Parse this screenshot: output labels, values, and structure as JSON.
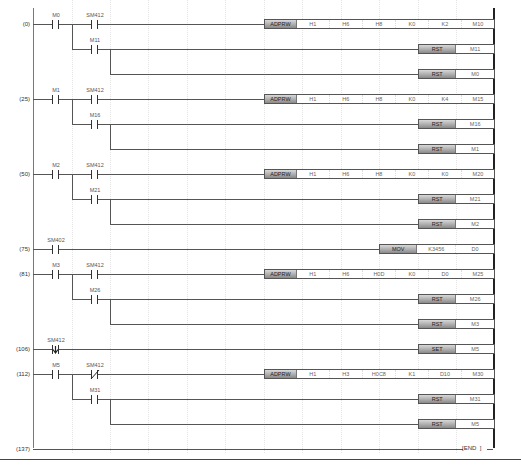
{
  "rungs": [
    {
      "step": "(0)",
      "y": 24,
      "contacts": [
        {
          "dev": "M0",
          "x": 33,
          "type": "no"
        },
        {
          "dev": "SM412",
          "x": 72,
          "type": "no"
        }
      ],
      "branch": {
        "dev": "M11",
        "y": 49,
        "type": "no"
      },
      "outputs": [
        {
          "y": 24,
          "op": "ADPRW",
          "args": [
            "H1",
            "H6",
            "H8",
            "K0",
            "K2",
            "M10"
          ]
        },
        {
          "y": 49,
          "op": "RST",
          "args": [
            "M11"
          ]
        },
        {
          "y": 74,
          "op": "RST",
          "args": [
            "M0"
          ]
        }
      ]
    },
    {
      "step": "(25)",
      "y": 99,
      "contacts": [
        {
          "dev": "M1",
          "x": 33,
          "type": "no"
        },
        {
          "dev": "SM412",
          "x": 72,
          "type": "no"
        }
      ],
      "branch": {
        "dev": "M16",
        "y": 124,
        "type": "no"
      },
      "outputs": [
        {
          "y": 99,
          "op": "ADPRW",
          "args": [
            "H1",
            "H6",
            "H8",
            "K0",
            "K4",
            "M15"
          ]
        },
        {
          "y": 124,
          "op": "RST",
          "args": [
            "M16"
          ]
        },
        {
          "y": 149,
          "op": "RST",
          "args": [
            "M1"
          ]
        }
      ]
    },
    {
      "step": "(50)",
      "y": 174,
      "contacts": [
        {
          "dev": "M2",
          "x": 33,
          "type": "no"
        },
        {
          "dev": "SM412",
          "x": 72,
          "type": "no"
        }
      ],
      "branch": {
        "dev": "M21",
        "y": 199,
        "type": "no"
      },
      "outputs": [
        {
          "y": 174,
          "op": "ADPRW",
          "args": [
            "H1",
            "H6",
            "H8",
            "K0",
            "K0",
            "M20"
          ]
        },
        {
          "y": 199,
          "op": "RST",
          "args": [
            "M21"
          ]
        },
        {
          "y": 224,
          "op": "RST",
          "args": [
            "M2"
          ]
        }
      ]
    },
    {
      "step": "(75)",
      "y": 249,
      "contacts": [
        {
          "dev": "SM402",
          "x": 33,
          "type": "no"
        }
      ],
      "outputs": [
        {
          "y": 249,
          "op": "MOV",
          "args": [
            "K3456",
            "D0"
          ]
        }
      ]
    },
    {
      "step": "(81)",
      "y": 274,
      "contacts": [
        {
          "dev": "M3",
          "x": 33,
          "type": "no"
        },
        {
          "dev": "SM412",
          "x": 72,
          "type": "no"
        }
      ],
      "branch": {
        "dev": "M26",
        "y": 299,
        "type": "no"
      },
      "outputs": [
        {
          "y": 274,
          "op": "ADPRW",
          "args": [
            "H1",
            "H6",
            "H0D",
            "K0",
            "D0",
            "M25"
          ]
        },
        {
          "y": 299,
          "op": "RST",
          "args": [
            "M26"
          ]
        },
        {
          "y": 324,
          "op": "RST",
          "args": [
            "M3"
          ]
        }
      ]
    },
    {
      "step": "(106)",
      "y": 349,
      "contacts": [
        {
          "dev": "SM412",
          "x": 33,
          "type": "falling"
        }
      ],
      "outputs": [
        {
          "y": 349,
          "op": "SET",
          "args": [
            "M5"
          ]
        }
      ]
    },
    {
      "step": "(112)",
      "y": 374,
      "contacts": [
        {
          "dev": "M5",
          "x": 33,
          "type": "no"
        },
        {
          "dev": "SM412",
          "x": 72,
          "type": "nc"
        }
      ],
      "branch": {
        "dev": "M31",
        "y": 399,
        "type": "no"
      },
      "outputs": [
        {
          "y": 374,
          "op": "ADPRW",
          "args": [
            "H1",
            "H3",
            "H0C8",
            "K1",
            "D10",
            "M30"
          ]
        },
        {
          "y": 399,
          "op": "RST",
          "args": [
            "M31"
          ]
        },
        {
          "y": 424,
          "op": "RST",
          "args": [
            "M5"
          ]
        }
      ]
    },
    {
      "step": "(137)",
      "y": 449,
      "end": "END"
    }
  ],
  "labels": {
    "r0": {
      "step": "(0)",
      "c1": "M0",
      "c2": "SM412",
      "b": "M11",
      "o1": "ADPRW",
      "a1": "H1",
      "a2": "H6",
      "a3": "H8",
      "a4": "K0",
      "a5": "K2",
      "a6": "M10",
      "o2": "RST",
      "o2a": "M11",
      "o3": "RST",
      "o3a": "M0"
    },
    "r1": {
      "step": "(25)",
      "c1": "M1",
      "c2": "SM412",
      "b": "M16",
      "o1": "ADPRW",
      "a1": "H1",
      "a2": "H6",
      "a3": "H8",
      "a4": "K0",
      "a5": "K4",
      "a6": "M15",
      "o2": "RST",
      "o2a": "M16",
      "o3": "RST",
      "o3a": "M1"
    },
    "r2": {
      "step": "(50)",
      "c1": "M2",
      "c2": "SM412",
      "b": "M21",
      "o1": "ADPRW",
      "a1": "H1",
      "a2": "H6",
      "a3": "H8",
      "a4": "K0",
      "a5": "K0",
      "a6": "M20",
      "o2": "RST",
      "o2a": "M21",
      "o3": "RST",
      "o3a": "M2"
    },
    "r3": {
      "step": "(75)",
      "c1": "SM402",
      "o1": "MOV",
      "a1": "K3456",
      "a2": "D0"
    },
    "r4": {
      "step": "(81)",
      "c1": "M3",
      "c2": "SM412",
      "b": "M26",
      "o1": "ADPRW",
      "a1": "H1",
      "a2": "H6",
      "a3": "H0D",
      "a4": "K0",
      "a5": "D0",
      "a6": "M25",
      "o2": "RST",
      "o2a": "M26",
      "o3": "RST",
      "o3a": "M3"
    },
    "r5": {
      "step": "(106)",
      "c1": "SM412",
      "o1": "SET",
      "a1": "M5"
    },
    "r6": {
      "step": "(112)",
      "c1": "M5",
      "c2": "SM412",
      "b": "M31",
      "o1": "ADPRW",
      "a1": "H1",
      "a2": "H3",
      "a3": "H0C8",
      "a4": "K1",
      "a5": "D10",
      "a6": "M30",
      "o2": "RST",
      "o2a": "M31",
      "o3": "RST",
      "o3a": "M5"
    },
    "r7": {
      "step": "(137)",
      "end": "END"
    }
  }
}
